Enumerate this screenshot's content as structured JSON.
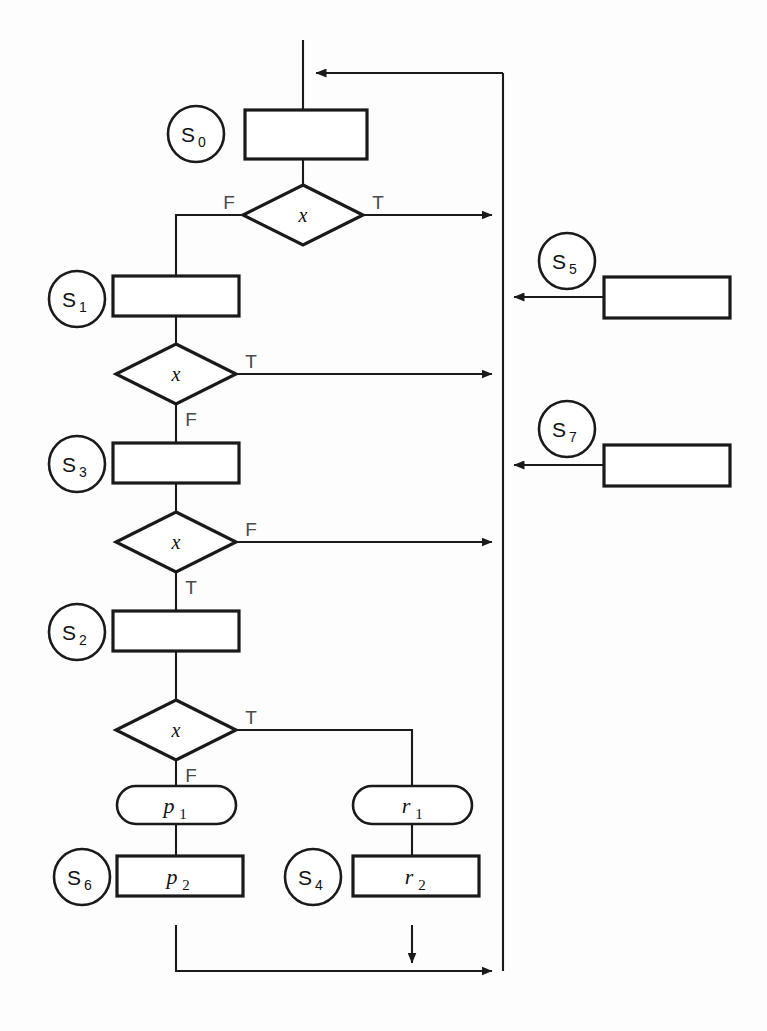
{
  "diagram": {
    "background": "#fdfdfd",
    "line_color": "#1a1a1a",
    "label_color": "#4a4a4a",
    "decision_symbol": "x",
    "branch_true": "T",
    "branch_false": "F"
  },
  "states": [
    {
      "id": "s0",
      "label": "S",
      "sub": "0"
    },
    {
      "id": "s1",
      "label": "S",
      "sub": "1"
    },
    {
      "id": "s3",
      "label": "S",
      "sub": "3"
    },
    {
      "id": "s2",
      "label": "S",
      "sub": "2"
    },
    {
      "id": "s6",
      "label": "S",
      "sub": "6"
    },
    {
      "id": "s4",
      "label": "S",
      "sub": "4"
    },
    {
      "id": "s5",
      "label": "S",
      "sub": "5"
    },
    {
      "id": "s7",
      "label": "S",
      "sub": "7"
    }
  ],
  "process_boxes": [
    {
      "id": "box_s0",
      "label": "",
      "sub": ""
    },
    {
      "id": "box_s1",
      "label": "",
      "sub": ""
    },
    {
      "id": "box_s3",
      "label": "",
      "sub": ""
    },
    {
      "id": "box_s2",
      "label": "",
      "sub": ""
    },
    {
      "id": "box_s5",
      "label": "",
      "sub": ""
    },
    {
      "id": "box_s7",
      "label": "",
      "sub": ""
    },
    {
      "id": "box_p2",
      "label": "p",
      "sub": "2"
    },
    {
      "id": "box_r2",
      "label": "r",
      "sub": "2"
    }
  ],
  "rounded_boxes": [
    {
      "id": "box_p1",
      "label": "p",
      "sub": "1"
    },
    {
      "id": "box_r1",
      "label": "r",
      "sub": "1"
    }
  ],
  "decisions": [
    {
      "id": "d0",
      "symbol": "x",
      "left_label": "F",
      "right_label": "T",
      "bottom_label": ""
    },
    {
      "id": "d1",
      "symbol": "x",
      "left_label": "",
      "right_label": "T",
      "bottom_label": "F"
    },
    {
      "id": "d3",
      "symbol": "x",
      "left_label": "",
      "right_label": "F",
      "bottom_label": "T"
    },
    {
      "id": "d2",
      "symbol": "x",
      "left_label": "",
      "right_label": "T",
      "bottom_label": "F"
    }
  ]
}
